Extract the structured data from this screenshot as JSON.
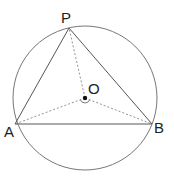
{
  "diagram": {
    "type": "geometry",
    "circle": {
      "label": "O",
      "cx": 85,
      "cy": 98,
      "r": 72
    },
    "points": [
      {
        "id": "P",
        "label": "P",
        "x": 69,
        "y": 28,
        "lx": 61,
        "ly": 23
      },
      {
        "id": "A",
        "label": "A",
        "x": 15,
        "y": 124,
        "lx": 4,
        "ly": 137
      },
      {
        "id": "B",
        "label": "B",
        "x": 152,
        "y": 124,
        "lx": 154,
        "ly": 133
      },
      {
        "id": "O",
        "label": "O",
        "x": 85,
        "y": 98,
        "lx": 88,
        "ly": 94
      }
    ],
    "solid_segments": [
      [
        "P",
        "A"
      ],
      [
        "P",
        "B"
      ],
      [
        "A",
        "B"
      ]
    ],
    "dashed_segments": [
      [
        "O",
        "P"
      ],
      [
        "O",
        "A"
      ],
      [
        "O",
        "B"
      ]
    ],
    "colors": {
      "line": "#555555",
      "circle": "#777777",
      "dash": "#777777",
      "point": "#111111"
    }
  }
}
